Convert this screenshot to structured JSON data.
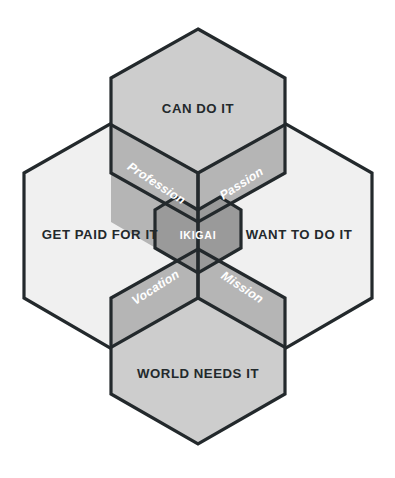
{
  "diagram": {
    "type": "venn-hexagon",
    "title": "Ikigai",
    "background_color": "#ffffff",
    "outline_color": "#23292c",
    "circles": [
      {
        "id": "can-do-it",
        "label": "CAN DO IT",
        "position": "top",
        "fill": "#cdcdcd",
        "text_color": "#23292c"
      },
      {
        "id": "get-paid-for-it",
        "label": "GET PAID FOR IT",
        "position": "left",
        "fill": "#f0f0f0",
        "text_color": "#23292c"
      },
      {
        "id": "want-to-do-it",
        "label": "WANT TO DO IT",
        "position": "right",
        "fill": "#f0f0f0",
        "text_color": "#23292c"
      },
      {
        "id": "world-needs-it",
        "label": "WORLD NEEDS IT",
        "position": "bottom",
        "fill": "#cdcdcd",
        "text_color": "#23292c"
      }
    ],
    "overlaps": [
      {
        "id": "profession",
        "label": "Profession",
        "between": [
          "CAN DO IT",
          "GET PAID FOR IT"
        ],
        "position": "top-left",
        "fill": "#b5b5b5",
        "text_color": "#ffffff",
        "rotation_deg": 33
      },
      {
        "id": "passion",
        "label": "Passion",
        "between": [
          "CAN DO IT",
          "WANT TO DO IT"
        ],
        "position": "top-right",
        "fill": "#b5b5b5",
        "text_color": "#ffffff",
        "rotation_deg": -33
      },
      {
        "id": "vocation",
        "label": "Vocation",
        "between": [
          "GET PAID FOR IT",
          "WORLD NEEDS IT"
        ],
        "position": "bottom-left",
        "fill": "#b5b5b5",
        "text_color": "#ffffff",
        "rotation_deg": -33
      },
      {
        "id": "mission",
        "label": "Mission",
        "between": [
          "WANT TO DO IT",
          "WORLD NEEDS IT"
        ],
        "position": "bottom-right",
        "fill": "#b5b5b5",
        "text_color": "#ffffff",
        "rotation_deg": 33
      }
    ],
    "center": {
      "id": "ikigai",
      "label": "IKIGAI",
      "shape": "heart",
      "fill": "#9a9a9a",
      "text_color": "#ffffff"
    }
  }
}
